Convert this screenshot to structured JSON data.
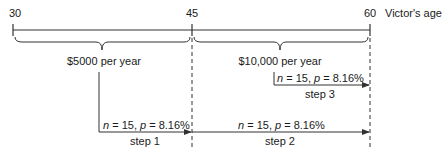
{
  "timeline": {
    "ticks": [
      {
        "label": "30",
        "x": 13
      },
      {
        "label": "45",
        "x": 192
      },
      {
        "label": "60",
        "x": 370
      }
    ],
    "axis_label": "Victor's age"
  },
  "braces": [
    {
      "label": "$5000 per year",
      "from": "30",
      "to": "45"
    },
    {
      "label": "$10,000 per year",
      "from": "45",
      "to": "60"
    }
  ],
  "steps": [
    {
      "name": "step 1",
      "n_label": "n",
      "n_value": "= 15,",
      "p_label": "p",
      "p_value": "= 8.16%"
    },
    {
      "name": "step 2",
      "n_label": "n",
      "n_value": "= 15,",
      "p_label": "p",
      "p_value": "= 8.16%"
    },
    {
      "name": "step 3",
      "n_label": "n",
      "n_value": "= 15,",
      "p_label": "p",
      "p_value": "= 8.16%"
    }
  ],
  "colors": {
    "line": "#333333",
    "text": "#1a1a1a"
  }
}
